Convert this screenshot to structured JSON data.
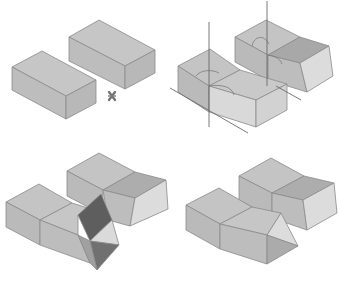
{
  "figure": {
    "layout": "2x2 grid",
    "colors": {
      "background": "#ffffff",
      "face_top": "#c4c4c4",
      "face_front": "#bdbdbd",
      "face_side": "#b4b4b4",
      "face_light": "#dcdcdc",
      "face_dark": "#a6a6a6",
      "face_darkest": "#5e5e5e",
      "edge": "#8a8a8a",
      "axis_line": "#6a6a6a"
    },
    "panels": [
      {
        "id": "panel-1",
        "position": "top-left",
        "content": "two separate rectangular blocks with a small cross marker between them"
      },
      {
        "id": "panel-2",
        "position": "top-right",
        "content": "both blocks bent with rotation axes and angle arcs"
      },
      {
        "id": "panel-3",
        "position": "bottom-left",
        "content": "bent blocks with triangular folding wedge faces between them"
      },
      {
        "id": "panel-4",
        "position": "bottom-right",
        "content": "bent blocks joined with a triangular prism end"
      }
    ],
    "markers": [
      {
        "panel": "panel-1",
        "icon": "cross-marker-icon",
        "x": 112,
        "y": 96
      }
    ]
  }
}
